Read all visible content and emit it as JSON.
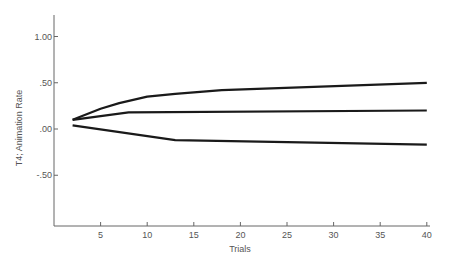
{
  "chart_data": {
    "type": "line",
    "title": "",
    "xlabel": "Trials",
    "ylabel": "T4; Animation Rate",
    "xlim": [
      0,
      41
    ],
    "ylim": [
      -1.0,
      1.2
    ],
    "xticks": [
      5,
      10,
      15,
      20,
      25,
      30,
      35,
      40
    ],
    "xtick_labels": [
      "5",
      "10",
      "15",
      "20",
      "25",
      "30",
      "35",
      "40"
    ],
    "yticks": [
      1.0,
      0.5,
      0.0,
      -0.5
    ],
    "ytick_labels": [
      "1.00",
      ".50",
      ".00",
      "-.50"
    ],
    "grid": false,
    "legend": null,
    "series": [
      {
        "name": "upper",
        "x": [
          2,
          5,
          7,
          10,
          13,
          18,
          40
        ],
        "y": [
          0.1,
          0.22,
          0.28,
          0.35,
          0.38,
          0.42,
          0.5
        ]
      },
      {
        "name": "middle",
        "x": [
          2,
          8,
          40
        ],
        "y": [
          0.1,
          0.18,
          0.2
        ]
      },
      {
        "name": "lower",
        "x": [
          2,
          13,
          40
        ],
        "y": [
          0.04,
          -0.12,
          -0.17
        ]
      }
    ],
    "line_color": "#1a1a1a"
  }
}
